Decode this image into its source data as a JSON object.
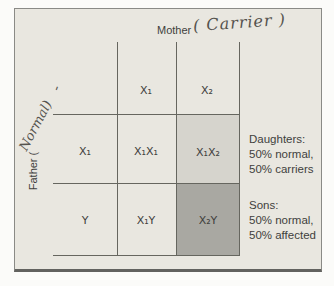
{
  "figure": {
    "mother": {
      "label": "Mother",
      "handwritten": "( Carrier )"
    },
    "father": {
      "label": "Father (",
      "handwritten": "Normal)",
      "tick": "'"
    },
    "grid": {
      "col_headers": [
        "X₁",
        "X₂"
      ],
      "row_headers": [
        "X₁",
        "Y"
      ],
      "cells": [
        [
          "X₁X₁",
          "X₁X₂"
        ],
        [
          "X₁Y",
          "X₂Y"
        ]
      ]
    },
    "results": {
      "daughters": {
        "title": "Daughters:",
        "line1": "50% normal,",
        "line2": "50% carriers"
      },
      "sons": {
        "title": "Sons:",
        "line1": "50% normal,",
        "line2": "50% affected"
      }
    },
    "colors": {
      "background": "#e9e7e0",
      "carrier_cell_shade": "#d6d4cd",
      "affected_cell_shade": "#a9a8a2",
      "grid_line": "#66665f",
      "text": "#3f3f3d"
    }
  }
}
